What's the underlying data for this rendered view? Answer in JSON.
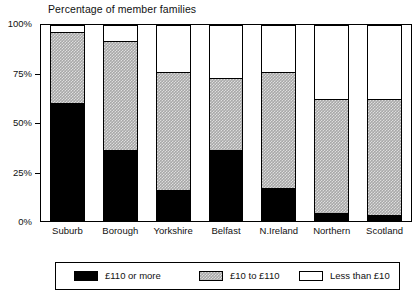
{
  "chart_data": {
    "type": "bar",
    "subtype": "stacked-bar-100",
    "title": "Percentage of member families",
    "xlabel": "",
    "ylabel": "",
    "ylim": [
      0,
      100
    ],
    "yticks": [
      0,
      25,
      50,
      75,
      100
    ],
    "ytick_labels": [
      "0%",
      "25%",
      "50%",
      "75%",
      "100%"
    ],
    "grid": false,
    "legend_position": "bottom",
    "categories": [
      "Suburb",
      "Borough",
      "Yorkshire",
      "Belfast",
      "N.Ireland",
      "Northern",
      "Scotland"
    ],
    "series": [
      {
        "name": "£110 or more",
        "color": "#000000",
        "pattern": "solid-black",
        "values": [
          60,
          36,
          16,
          36,
          17,
          4,
          3
        ]
      },
      {
        "name": "£10 to £110",
        "color": "#a8a8a8",
        "pattern": "grey-checker",
        "values": [
          36.5,
          56,
          60,
          37,
          59,
          58,
          59
        ]
      },
      {
        "name": "Less than £10",
        "color": "#ffffff",
        "pattern": "white",
        "values": [
          3.5,
          8,
          24,
          27,
          24,
          38,
          38
        ]
      }
    ],
    "cumulative_tops": {
      "high": [
        60,
        36,
        16,
        36,
        17,
        4,
        3
      ],
      "mid": [
        96.5,
        92,
        76,
        73,
        76,
        62,
        62
      ],
      "low": [
        100,
        100,
        100,
        100,
        100,
        100,
        100
      ]
    }
  },
  "legend": {
    "items": [
      {
        "label": "£110 or more",
        "swatch": "sw-high"
      },
      {
        "label": "£10 to £110",
        "swatch": "sw-mid"
      },
      {
        "label": "Less than £10",
        "swatch": "sw-low"
      }
    ]
  }
}
